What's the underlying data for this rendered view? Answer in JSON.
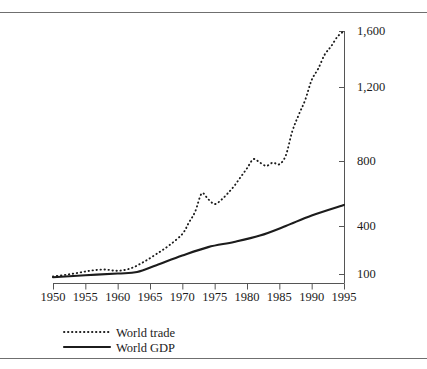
{
  "chart_data": {
    "type": "line",
    "title": "",
    "subtitle": "",
    "xlabel": "",
    "ylabel": "",
    "grid": false,
    "legend_position": "bottom-left",
    "xlim": [
      1950,
      1995
    ],
    "ylim": [
      60,
      1600
    ],
    "x_ticks": [
      "1950",
      "1955",
      "1960",
      "1965",
      "1970",
      "1975",
      "1980",
      "1985",
      "1990",
      "1995"
    ],
    "y_ticks": [
      "100",
      "400",
      "800",
      "1,200",
      "1,600"
    ],
    "y_tick_values": [
      100,
      400,
      800,
      1200,
      1600
    ],
    "series": [
      {
        "name": "World trade",
        "style": "dotted",
        "color": "#1c1c1c",
        "x": [
          1950,
          1952,
          1954,
          1956,
          1958,
          1960,
          1962,
          1964,
          1966,
          1968,
          1970,
          1971,
          1972,
          1973,
          1974,
          1975,
          1976,
          1977,
          1978,
          1979,
          1980,
          1981,
          1982,
          1983,
          1984,
          1985,
          1986,
          1987,
          1988,
          1989,
          1990,
          1991,
          1992,
          1993,
          1994,
          1995
        ],
        "values": [
          85,
          95,
          108,
          122,
          128,
          120,
          135,
          175,
          225,
          280,
          350,
          420,
          490,
          600,
          565,
          535,
          560,
          600,
          645,
          700,
          755,
          810,
          790,
          770,
          790,
          780,
          830,
          960,
          1050,
          1130,
          1250,
          1330,
          1430,
          1490,
          1560,
          1600
        ]
      },
      {
        "name": "World GDP",
        "style": "solid",
        "color": "#1c1c1c",
        "x": [
          1950,
          1955,
          1960,
          1963,
          1966,
          1970,
          1974,
          1978,
          1982,
          1986,
          1990,
          1995
        ],
        "values": [
          80,
          92,
          103,
          112,
          155,
          215,
          268,
          300,
          340,
          400,
          465,
          530
        ]
      }
    ]
  },
  "legend": {
    "items": [
      {
        "label": "World trade",
        "style": "dotted"
      },
      {
        "label": "World GDP",
        "style": "solid"
      }
    ]
  },
  "axes": {
    "y_axis_side": "right",
    "x_axis_side": "bottom"
  }
}
